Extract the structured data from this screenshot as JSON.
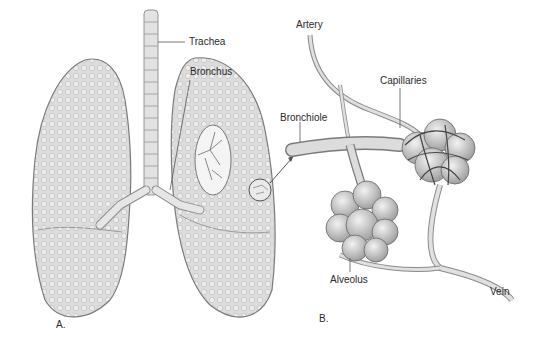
{
  "figure": {
    "panel_a": {
      "label": "A.",
      "callouts": {
        "trachea": "Trachea",
        "bronchus": "Bronchus"
      }
    },
    "panel_b": {
      "label": "B.",
      "callouts": {
        "artery": "Artery",
        "capillaries": "Capillaries",
        "bronchiole": "Bronchiole",
        "alveolus": "Alveolus",
        "vein": "Vein"
      }
    }
  }
}
